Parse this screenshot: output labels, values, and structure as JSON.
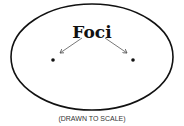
{
  "diagram": {
    "label": "Foci",
    "caption": "(DRAWN TO SCALE)",
    "ellipse": {
      "cx": 92,
      "cy": 57,
      "rx": 81,
      "ry": 53,
      "stroke": "#111111"
    },
    "foci": [
      {
        "x": 53,
        "y": 60
      },
      {
        "x": 133,
        "y": 60
      }
    ]
  }
}
